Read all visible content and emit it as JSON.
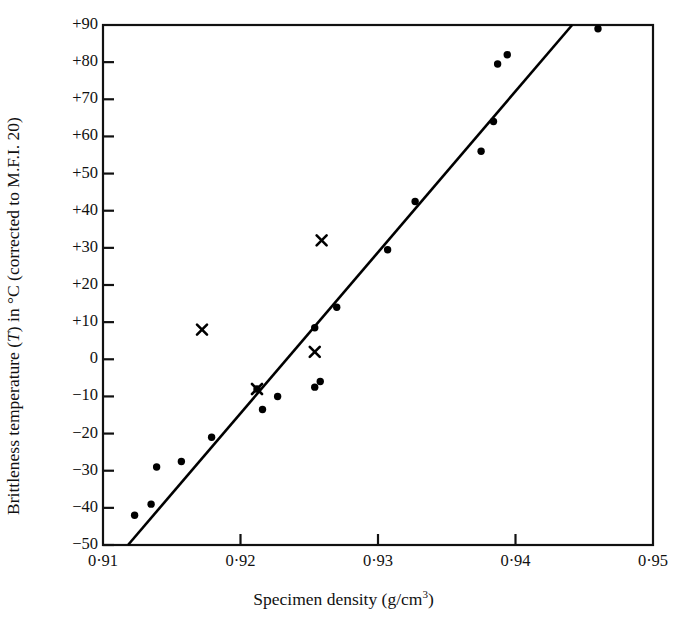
{
  "chart_data": {
    "type": "scatter",
    "title": "",
    "xlabel": "Specimen density (g/cm3)",
    "ylabel": "Brittleness temperature (T) in °C (corrected to M.F.I. 20)",
    "xlim": [
      0.91,
      0.95
    ],
    "ylim": [
      -50,
      90
    ],
    "xticks": [
      0.91,
      0.92,
      0.93,
      0.94,
      0.95
    ],
    "xtick_labels": [
      "0·91",
      "0·92",
      "0·93",
      "0·94",
      "0·95"
    ],
    "yticks": [
      90,
      80,
      70,
      60,
      50,
      40,
      30,
      20,
      10,
      0,
      -10,
      -20,
      -30,
      -40,
      -50
    ],
    "ytick_labels": [
      "+90",
      "+80",
      "+70",
      "+60",
      "+50",
      "+40",
      "+30",
      "+20",
      "+10",
      "0",
      "−10",
      "−20",
      "−30",
      "−40",
      "−50"
    ],
    "grid": false,
    "legend": "none",
    "series": [
      {
        "name": "dot-markers",
        "marker": "circle",
        "color": "#000000",
        "points": [
          [
            0.9123,
            -42.0
          ],
          [
            0.9135,
            -39.0
          ],
          [
            0.9139,
            -29.0
          ],
          [
            0.9157,
            -27.5
          ],
          [
            0.9179,
            -21.0
          ],
          [
            0.9212,
            -8.0
          ],
          [
            0.9216,
            -13.5
          ],
          [
            0.9227,
            -10.0
          ],
          [
            0.9254,
            -7.5
          ],
          [
            0.9258,
            -6.0
          ],
          [
            0.9254,
            8.5
          ],
          [
            0.927,
            14.0
          ],
          [
            0.9307,
            29.5
          ],
          [
            0.9327,
            42.5
          ],
          [
            0.9375,
            56.0
          ],
          [
            0.9384,
            64.0
          ],
          [
            0.9387,
            79.5
          ],
          [
            0.9394,
            82.0
          ],
          [
            0.946,
            89.0
          ]
        ]
      },
      {
        "name": "cross-markers",
        "marker": "x",
        "color": "#000000",
        "points": [
          [
            0.9172,
            8.0
          ],
          [
            0.9212,
            -8.0
          ],
          [
            0.9254,
            2.0
          ],
          [
            0.9259,
            32.0
          ]
        ]
      }
    ],
    "trendline": {
      "name": "regression-line",
      "color": "#000000",
      "x_start": 0.91182,
      "y_start": -50.0,
      "x_end": 0.94412,
      "y_end": 90.0
    }
  },
  "axis": {
    "y_title_lead": "Brittleness temperature (",
    "y_title_italic": "T",
    "y_title_tail": ") in °C (corrected to M.F.I. 20)",
    "x_title_lead": "Specimen density (g/cm",
    "x_title_sup": "3",
    "x_title_tail": ")"
  }
}
